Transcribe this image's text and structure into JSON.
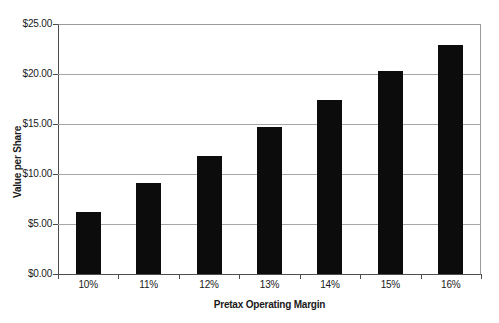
{
  "chart_data": {
    "type": "bar",
    "title": "",
    "xlabel": "Pretax Operating Margin",
    "ylabel": "Value per Share",
    "categories": [
      "10%",
      "11%",
      "12%",
      "13%",
      "14%",
      "15%",
      "16%"
    ],
    "values": [
      6.2,
      9.1,
      11.8,
      14.7,
      17.4,
      20.3,
      22.9
    ],
    "ylim": [
      0,
      25
    ],
    "ytick_step": 5,
    "ytick_values": [
      0,
      5,
      10,
      15,
      20,
      25
    ],
    "ytick_labels": [
      "$0.00",
      "$5.00",
      "$10.00",
      "$15.00",
      "$20.00",
      "$25.00"
    ],
    "grid": true,
    "legend": false,
    "bar_color": "#0c0c0c",
    "gridline_color": "#a6a6a6",
    "text_color": "#1a1a1a"
  }
}
